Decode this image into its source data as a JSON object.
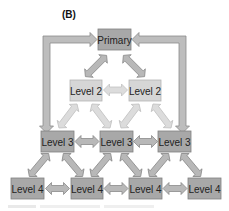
{
  "panel_label": "(B)",
  "colors": {
    "node_dark_fill": "#a8a8a8",
    "node_dark_stroke": "#808080",
    "node_light_fill": "#d6d6d6",
    "node_light_stroke": "#b4b4b4",
    "arrow_dark_fill": "#b8b8b8",
    "arrow_dark_stroke": "#8a8a8a",
    "arrow_light_fill": "#dcdcdc",
    "arrow_light_stroke": "#c2c2c2"
  },
  "nodes": {
    "primary": {
      "label": "Primary"
    },
    "level2": [
      {
        "label": "Level 2"
      },
      {
        "label": "Level 2"
      }
    ],
    "level3": [
      {
        "label": "Level 3"
      },
      {
        "label": "Level 3"
      },
      {
        "label": "Level 3"
      }
    ],
    "level4": [
      {
        "label": "Level 4"
      },
      {
        "label": "Level 4"
      },
      {
        "label": "Level 4"
      },
      {
        "label": "Level 4"
      }
    ]
  },
  "edges": [
    {
      "from": "Primary",
      "to": "Level 2 (left)",
      "type": "bidirectional"
    },
    {
      "from": "Primary",
      "to": "Level 2 (right)",
      "type": "bidirectional"
    },
    {
      "from": "Level 2 (left)",
      "to": "Level 2 (right)",
      "type": "bidirectional"
    },
    {
      "from": "Level 2 (left)",
      "to": "Level 3 (left)",
      "type": "bidirectional"
    },
    {
      "from": "Level 2 (left)",
      "to": "Level 3 (middle)",
      "type": "bidirectional"
    },
    {
      "from": "Level 2 (right)",
      "to": "Level 3 (middle)",
      "type": "bidirectional"
    },
    {
      "from": "Level 2 (right)",
      "to": "Level 3 (right)",
      "type": "bidirectional"
    },
    {
      "from": "Level 3 (left)",
      "to": "Level 3 (middle)",
      "type": "bidirectional"
    },
    {
      "from": "Level 3 (middle)",
      "to": "Level 3 (right)",
      "type": "bidirectional"
    },
    {
      "from": "Level 3 (left)",
      "to": "Level 4 (1)",
      "type": "bidirectional"
    },
    {
      "from": "Level 3 (left)",
      "to": "Level 4 (2)",
      "type": "bidirectional"
    },
    {
      "from": "Level 3 (middle)",
      "to": "Level 4 (2)",
      "type": "bidirectional"
    },
    {
      "from": "Level 3 (middle)",
      "to": "Level 4 (3)",
      "type": "bidirectional"
    },
    {
      "from": "Level 3 (right)",
      "to": "Level 4 (3)",
      "type": "bidirectional"
    },
    {
      "from": "Level 3 (right)",
      "to": "Level 4 (4)",
      "type": "bidirectional"
    },
    {
      "from": "Level 4 (1)",
      "to": "Level 4 (2)",
      "type": "bidirectional"
    },
    {
      "from": "Level 4 (2)",
      "to": "Level 4 (3)",
      "type": "bidirectional"
    },
    {
      "from": "Level 4 (3)",
      "to": "Level 4 (4)",
      "type": "bidirectional"
    },
    {
      "from": "Level 3 (left)",
      "to": "Primary",
      "type": "loop-frame"
    },
    {
      "from": "Level 3 (right)",
      "to": "Primary",
      "type": "loop-frame"
    }
  ]
}
